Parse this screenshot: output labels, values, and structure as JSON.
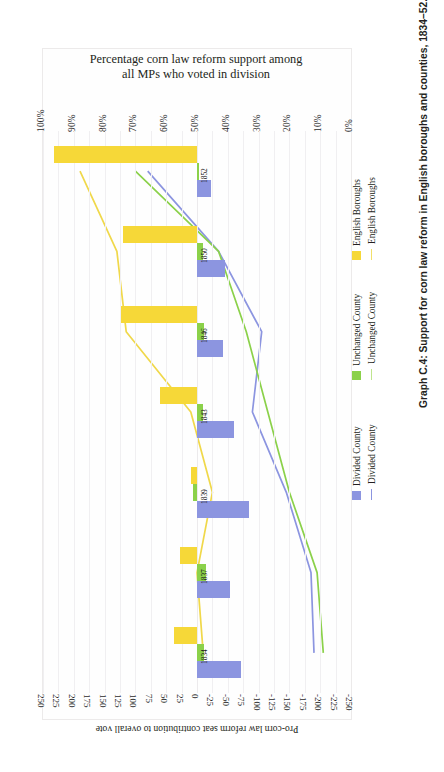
{
  "figure": {
    "caption": "Graph C.4: Support for corn law reform in English boroughs and counties, 1834–52.",
    "title_line1": "Percentage corn law reform support among",
    "title_line2": "all MPs who voted in division"
  },
  "axes": {
    "percent_axis_label": "",
    "percent_ticks": [
      "100%",
      "90%",
      "80%",
      "70%",
      "60%",
      "50%",
      "40%",
      "30%",
      "20%",
      "10%",
      "0%"
    ],
    "value_axis_title": "Pro-corn law reform seat contribution to overall vote",
    "value_ticks": [
      "250",
      "225",
      "200",
      "175",
      "150",
      "125",
      "100",
      "75",
      "50",
      "25",
      "0",
      "-25",
      "-50",
      "-75",
      "-100",
      "-125",
      "-150",
      "-175",
      "-200",
      "-225",
      "-250"
    ]
  },
  "legend": {
    "items": [
      {
        "label": "Divided County",
        "kind": "bar",
        "color": "#8c95e0"
      },
      {
        "label": "Divided County",
        "kind": "line",
        "color": "#8c95e0"
      },
      {
        "label": "Unchanged County",
        "kind": "bar",
        "color": "#8bd14a"
      },
      {
        "label": "Unchanged County",
        "kind": "line",
        "color": "#bfe58f"
      },
      {
        "label": "English Boroughs",
        "kind": "bar",
        "color": "#f6d838"
      },
      {
        "label": "English Boroughs",
        "kind": "line",
        "color": "#f2e06a"
      }
    ]
  },
  "colors": {
    "divided_county": "#8c95e0",
    "unchanged_county": "#8bd14a",
    "english_boroughs": "#f6d838",
    "line_divided": "#8c95e0",
    "line_unchanged": "#8bd14a",
    "line_boroughs": "#f0d84a",
    "grid": "#f0eff1"
  },
  "chart_data": {
    "type": "bar",
    "title": "Percentage corn law reform support among all MPs who voted in division",
    "xlabel": "Pro-corn law reform seat contribution to overall vote",
    "ylabel": "Percentage corn law reform support among all MPs who voted in division",
    "categories": [
      "1834",
      "1837",
      "1839",
      "1843",
      "1846",
      "1850",
      "1852"
    ],
    "value_axis_range": [
      -250,
      250
    ],
    "percent_axis_range": [
      0,
      100
    ],
    "grid": true,
    "legend_position": "right",
    "orientation": "rotated-90",
    "bar_series": [
      {
        "name": "Divided County",
        "color": "#8c95e0",
        "unit": "seat contribution",
        "values": [
          -72,
          -53,
          -85,
          -60,
          -42,
          -45,
          -22
        ]
      },
      {
        "name": "Unchanged County",
        "color": "#8bd14a",
        "unit": "seat contribution",
        "values": [
          -12,
          -14,
          6,
          -9,
          -11,
          -9,
          -3
        ]
      },
      {
        "name": "English Boroughs",
        "color": "#f6d838",
        "unit": "seat contribution",
        "values": [
          37,
          28,
          10,
          60,
          123,
          120,
          232
        ]
      }
    ],
    "line_series": [
      {
        "name": "Divided County",
        "color": "#8c95e0",
        "unit": "percent",
        "values": [
          12,
          13,
          21,
          32,
          29,
          43,
          66
        ]
      },
      {
        "name": "Unchanged County",
        "color": "#8bd14a",
        "unit": "percent",
        "values": [
          9,
          11,
          20,
          27,
          34,
          43,
          70
        ]
      },
      {
        "name": "English Boroughs",
        "color": "#f0d84a",
        "unit": "percent",
        "values": [
          48,
          50,
          45,
          52,
          73,
          76,
          88
        ]
      }
    ]
  }
}
